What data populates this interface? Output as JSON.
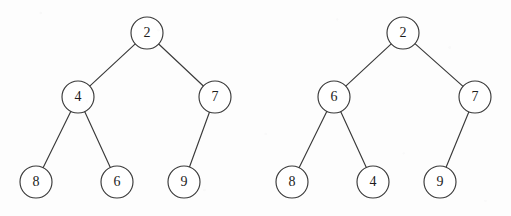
{
  "figure": {
    "background_color": "#fdfdfd",
    "stroke_color": "#3a3a3a",
    "node_fill_color": "#ffffff",
    "label_color": "#1c1c1c",
    "node_radius": 16,
    "width": 511,
    "height": 216
  },
  "diagrams": [
    {
      "id": "left-tree",
      "name": "binary-tree-left",
      "nodes": [
        {
          "id": "L-root",
          "label": "2",
          "cx": 147,
          "cy": 33,
          "r": 16
        },
        {
          "id": "L-n4",
          "label": "4",
          "cx": 78,
          "cy": 97,
          "r": 16
        },
        {
          "id": "L-n7",
          "label": "7",
          "cx": 215,
          "cy": 97,
          "r": 16
        },
        {
          "id": "L-n8",
          "label": "8",
          "cx": 36,
          "cy": 182,
          "r": 16
        },
        {
          "id": "L-n6",
          "label": "6",
          "cx": 117,
          "cy": 182,
          "r": 16
        },
        {
          "id": "L-n9",
          "label": "9",
          "cx": 184,
          "cy": 182,
          "r": 16
        }
      ],
      "edges": [
        {
          "id": "L-e1",
          "from": "L-root",
          "to": "L-n4",
          "side": "left"
        },
        {
          "id": "L-e2",
          "from": "L-root",
          "to": "L-n7",
          "side": "right"
        },
        {
          "id": "L-e3",
          "from": "L-n4",
          "to": "L-n8",
          "side": "left"
        },
        {
          "id": "L-e4",
          "from": "L-n4",
          "to": "L-n6",
          "side": "right"
        },
        {
          "id": "L-e5",
          "from": "L-n7",
          "to": "L-n9",
          "side": "left"
        }
      ]
    },
    {
      "id": "right-tree",
      "name": "binary-tree-right",
      "nodes": [
        {
          "id": "R-root",
          "label": "2",
          "cx": 403,
          "cy": 33,
          "r": 16
        },
        {
          "id": "R-n6",
          "label": "6",
          "cx": 334,
          "cy": 97,
          "r": 16
        },
        {
          "id": "R-n7",
          "label": "7",
          "cx": 475,
          "cy": 97,
          "r": 16
        },
        {
          "id": "R-n8",
          "label": "8",
          "cx": 292,
          "cy": 182,
          "r": 16
        },
        {
          "id": "R-n4",
          "label": "4",
          "cx": 373,
          "cy": 182,
          "r": 16
        },
        {
          "id": "R-n9",
          "label": "9",
          "cx": 440,
          "cy": 182,
          "r": 16
        }
      ],
      "edges": [
        {
          "id": "R-e1",
          "from": "R-root",
          "to": "R-n6",
          "side": "left"
        },
        {
          "id": "R-e2",
          "from": "R-root",
          "to": "R-n7",
          "side": "right"
        },
        {
          "id": "R-e3",
          "from": "R-n6",
          "to": "R-n8",
          "side": "left"
        },
        {
          "id": "R-e4",
          "from": "R-n6",
          "to": "R-n4",
          "side": "right"
        },
        {
          "id": "R-e5",
          "from": "R-n7",
          "to": "R-n9",
          "side": "left"
        }
      ]
    }
  ]
}
